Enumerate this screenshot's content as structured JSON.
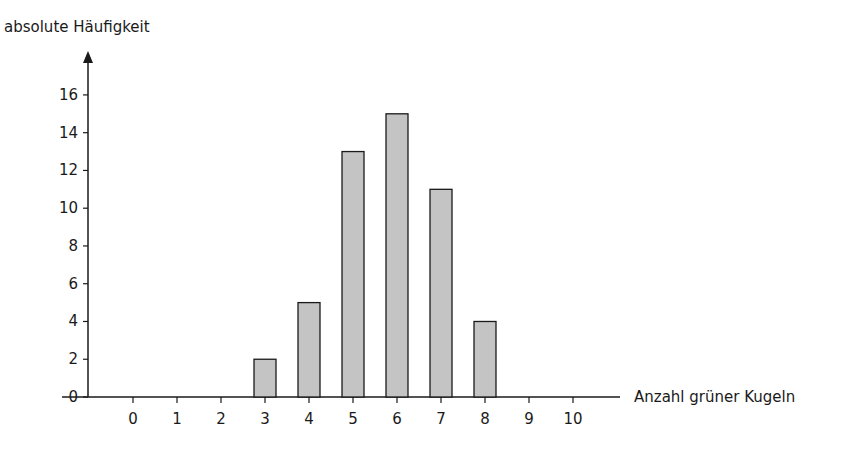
{
  "chart_data": {
    "type": "bar",
    "title": "",
    "ylabel": "absolute Häufigkeit",
    "xlabel": "Anzahl grüner Kugeln",
    "categories": [
      "0",
      "1",
      "2",
      "3",
      "4",
      "5",
      "6",
      "7",
      "8",
      "9",
      "10"
    ],
    "values": [
      0,
      0,
      0,
      2,
      5,
      13,
      15,
      11,
      4,
      0,
      0
    ],
    "yticks": [
      0,
      2,
      4,
      6,
      8,
      10,
      12,
      14,
      16
    ],
    "ylim": [
      0,
      17
    ],
    "grid": false,
    "legend": null,
    "bar_color": "#c4c4c4",
    "bar_edge_color": "#1a1a1a",
    "axis_color": "#1a1a1a"
  }
}
